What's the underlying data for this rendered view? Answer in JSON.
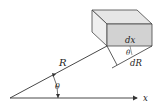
{
  "diagram": {
    "labels": {
      "R": "R",
      "theta_origin": "θ",
      "theta_box": "θ",
      "dx": "dx",
      "dR": "dR",
      "x_axis": "x"
    },
    "colors": {
      "line": "#333333",
      "box_top": "#e6e6e6",
      "box_left": "#efefef",
      "box_front": "#d2d2d2",
      "background": "#ffffff"
    }
  }
}
